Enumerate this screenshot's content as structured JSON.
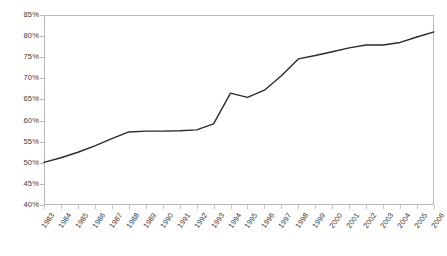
{
  "chart_data": {
    "type": "line",
    "title": "",
    "subtitle": "",
    "xlabel": "",
    "ylabel": "",
    "legend": [],
    "legend_position": "none",
    "grid": false,
    "xlim": [
      1983,
      2006
    ],
    "ylim": [
      0.4,
      0.85
    ],
    "ytick_format": "percent",
    "yticks": [
      0.85,
      0.8,
      0.75,
      0.7,
      0.65,
      0.6,
      0.55,
      0.5,
      0.45,
      0.4
    ],
    "ytick_labels": [
      "85%",
      "80%",
      "75%",
      "70%",
      "65%",
      "60%",
      "55%",
      "50%",
      "45%",
      "40%"
    ],
    "categories": [
      "1983",
      "1984",
      "1985",
      "1986",
      "1987",
      "1988",
      "1989",
      "1990",
      "1991",
      "1992",
      "1993",
      "1994",
      "1995",
      "1996",
      "1997",
      "1998",
      "1999",
      "2000",
      "2001",
      "2002",
      "2003",
      "2004",
      "2005",
      "2006"
    ],
    "x": [
      1983,
      1984,
      1985,
      1986,
      1987,
      1988,
      1989,
      1990,
      1991,
      1992,
      1993,
      1994,
      1995,
      1996,
      1997,
      1998,
      1999,
      2000,
      2001,
      2002,
      2003,
      2004,
      2005,
      2006
    ],
    "series": [
      {
        "name": "rate",
        "color": "#2b2b2b",
        "values": [
          0.501,
          0.512,
          0.525,
          0.54,
          0.557,
          0.573,
          0.575,
          0.575,
          0.576,
          0.578,
          0.592,
          0.665,
          0.655,
          0.672,
          0.706,
          0.746,
          0.754,
          0.763,
          0.772,
          0.779,
          0.779,
          0.785,
          0.798,
          0.81
        ],
        "value_labels": [
          "50.1%",
          "51.2%",
          "52.5%",
          "54.0%",
          "55.7%",
          "57.3%",
          "57.5%",
          "57.5%",
          "57.6%",
          "57.8%",
          "59.2%",
          "66.5%",
          "65.5%",
          "67.2%",
          "70.6%",
          "74.6%",
          "75.4%",
          "76.3%",
          "77.2%",
          "77.9%",
          "77.9%",
          "78.5%",
          "79.8%",
          "81.0%"
        ]
      }
    ],
    "annotations": [],
    "colors": {
      "line": "#2b2b2b",
      "frame": "#b9b9b9",
      "tick": "#bcbcbc",
      "text": "#3a3a3a",
      "background": "#ffffff"
    }
  }
}
